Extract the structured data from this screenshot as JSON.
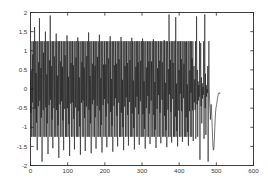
{
  "figure": {
    "background_color": "#ffffff",
    "axis_color": "#2b2b2b",
    "line_color": "#1c1c1c",
    "tick_label_color": "#3a3a3a"
  },
  "chart_data": {
    "type": "line",
    "title": "",
    "subtitle": "",
    "xlabel": "",
    "ylabel": "",
    "xlim": [
      0,
      600
    ],
    "ylim": [
      -2,
      2
    ],
    "xticks": [
      0,
      100,
      200,
      300,
      400,
      500,
      600
    ],
    "xticklabels": [
      "0",
      "100",
      "200",
      "300",
      "400",
      "500",
      "600"
    ],
    "yticks": [
      -2,
      -1.5,
      -1,
      -0.5,
      0,
      0.5,
      1,
      1.5,
      2
    ],
    "yticklabels": [
      "-2",
      "-1.5",
      "-1",
      "-0.5",
      "0",
      "0.5",
      "1",
      "1.5",
      "2"
    ],
    "grid": false,
    "legend": false,
    "legend_position": "none",
    "annotations": [],
    "series": [
      {
        "name": "signal",
        "color": "#1c1c1c",
        "linewidth": 0.62,
        "description": "Dense high-frequency oscillating waveform spanning x from 0 to about 510, clipped envelope near plus and minus 1.25 with intermittent spikes reaching plus and minus 2, becoming sparse after x of about 400 and ending with a smooth low-frequency tail dipping to about -1.6 near x of 490 before rising to about -0.1 at x of 510.",
        "x_start": 0,
        "x_end": 510,
        "envelope_typical": 1.25,
        "envelope_peak": 2.0,
        "values": [
          0.25,
          -0.62,
          0.48,
          -1.25,
          1.25,
          -0.35,
          0.9,
          -1.25,
          1.25,
          0.1,
          -1.25,
          1.62,
          -0.52,
          1.25,
          -1.25,
          0.42,
          -0.88,
          1.25,
          -1.6,
          0.35,
          1.25,
          -0.45,
          0.7,
          -1.25,
          1.85,
          -0.3,
          1.25,
          -1.25,
          0.55,
          -0.75,
          1.25,
          -1.9,
          0.4,
          1.25,
          -0.55,
          0.95,
          -1.25,
          1.25,
          0.2,
          -1.25,
          1.5,
          -0.48,
          1.25,
          -1.25,
          0.38,
          -0.9,
          1.25,
          -1.7,
          0.3,
          1.25,
          -0.42,
          0.75,
          -1.25,
          1.92,
          -0.28,
          1.25,
          -1.25,
          0.6,
          -0.8,
          1.25,
          -1.55,
          0.45,
          1.25,
          -0.5,
          0.85,
          -1.25,
          1.25,
          0.15,
          -1.25,
          1.45,
          -0.55,
          1.25,
          -1.25,
          0.35,
          -0.95,
          1.25,
          -1.8,
          0.28,
          1.25,
          -0.4,
          0.72,
          -1.25,
          1.25,
          -0.32,
          1.25,
          -1.25,
          0.58,
          -0.82,
          1.25,
          -1.6,
          0.42,
          1.25,
          -0.52,
          0.88,
          -1.25,
          1.25,
          0.18,
          -1.25,
          1.4,
          -0.5,
          1.25,
          -1.25,
          0.32,
          -0.92,
          1.25,
          -1.75,
          0.25,
          1.25,
          -0.38,
          0.68,
          -1.25,
          1.25,
          -0.35,
          1.25,
          -1.25,
          0.62,
          -0.78,
          1.25,
          -1.58,
          0.4,
          1.25,
          -0.48,
          0.82,
          -1.25,
          1.25,
          0.22,
          -1.25,
          1.35,
          -0.58,
          1.25,
          -1.25,
          0.3,
          -0.98,
          1.25,
          -1.72,
          0.26,
          1.25,
          -0.36,
          0.7,
          -1.25,
          1.25,
          -0.3,
          1.25,
          -1.25,
          0.56,
          -0.76,
          1.25,
          -1.62,
          0.38,
          1.25,
          -0.46,
          0.86,
          -1.25,
          1.25,
          0.2,
          -1.25,
          1.48,
          -0.54,
          1.25,
          -1.25,
          0.34,
          -0.9,
          1.25,
          -1.68,
          0.24,
          1.25,
          -0.4,
          0.66,
          -1.25,
          1.25,
          -0.28,
          1.25,
          -1.25,
          0.6,
          -0.74,
          1.25,
          -1.56,
          0.36,
          1.25,
          -0.44,
          0.84,
          -1.25,
          1.25,
          0.16,
          -1.25,
          1.42,
          -0.56,
          1.25,
          -1.25,
          0.28,
          -0.94,
          1.25,
          -1.66,
          0.22,
          1.25,
          -0.42,
          0.64,
          -1.25,
          1.25,
          -0.26,
          1.25,
          -1.25,
          0.64,
          -0.72,
          1.25,
          -1.52,
          0.34,
          1.25,
          -0.38,
          0.8,
          -1.25,
          1.25,
          0.14,
          -1.25,
          1.38,
          -0.6,
          1.25,
          -1.25,
          0.26,
          -0.96,
          1.25,
          -1.64,
          0.2,
          1.25,
          -0.44,
          0.62,
          -1.25,
          1.25,
          -0.24,
          1.25,
          -1.25,
          0.66,
          -0.7,
          1.25,
          -1.5,
          0.32,
          1.25,
          -0.36,
          0.78,
          -1.25,
          1.25,
          0.12,
          -1.25,
          1.36,
          -0.62,
          1.25,
          -1.25,
          0.24,
          -1.0,
          1.25,
          -1.6,
          0.18,
          1.25,
          -0.46,
          0.6,
          -1.25,
          1.25,
          -0.22,
          1.25,
          -1.25,
          0.68,
          -0.68,
          1.25,
          -1.48,
          0.3,
          1.25,
          -0.34,
          0.76,
          -1.25,
          1.25,
          0.1,
          -1.25,
          1.34,
          -0.64,
          1.25,
          -1.25,
          0.22,
          -1.02,
          1.25,
          -1.58,
          0.16,
          1.25,
          -0.48,
          0.58,
          -1.25,
          1.25,
          -0.2,
          1.25,
          -1.25,
          0.7,
          -0.66,
          1.25,
          -1.46,
          0.28,
          1.25,
          -0.32,
          0.74,
          -1.25,
          1.25,
          0.08,
          -1.25,
          1.32,
          -0.66,
          1.25,
          -1.25,
          0.2,
          -1.04,
          1.25,
          -1.56,
          0.14,
          1.25,
          -0.5,
          0.56,
          -1.25,
          1.25,
          -0.18,
          1.25,
          -1.25,
          0.72,
          -0.64,
          1.25,
          -1.44,
          0.26,
          1.25,
          -0.3,
          0.72,
          -1.25,
          1.25,
          0.06,
          -1.25,
          1.3,
          -0.68,
          1.25,
          -1.25,
          0.18,
          -1.06,
          1.25,
          -1.54,
          0.12,
          1.25,
          -0.52,
          0.54,
          -1.25,
          1.25,
          -0.16,
          1.25,
          -1.25,
          0.74,
          -0.62,
          1.25,
          -1.42,
          0.24,
          1.25,
          -0.28,
          0.7,
          -1.25,
          1.25,
          0.04,
          -1.25,
          1.28,
          -0.7,
          1.25,
          -1.25,
          0.16,
          -1.08,
          1.25,
          -1.52,
          0.1,
          1.25,
          -0.54,
          0.52,
          -1.25,
          1.95,
          -0.14,
          1.25,
          -1.25,
          0.76,
          -0.6,
          1.25,
          -1.4,
          0.22,
          1.25,
          -0.26,
          0.68,
          -1.25,
          1.25,
          0.02,
          -1.25,
          1.26,
          -0.72,
          1.88,
          -1.25,
          0.14,
          -1.1,
          1.25,
          -1.5,
          0.08,
          1.25,
          -0.56,
          0.5,
          -1.25,
          1.25,
          -0.12,
          1.25,
          -1.25,
          0.78,
          -0.58,
          1.25,
          -1.38,
          0.2,
          1.25,
          -0.24,
          0.66,
          -1.25,
          1.25,
          0.0,
          -1.25,
          1.24,
          -0.74,
          1.25,
          -1.25,
          0.12,
          -1.12,
          1.25,
          -1.48,
          0.06,
          1.25,
          -0.58,
          0.48,
          -1.25,
          1.25,
          -0.1,
          1.25,
          -1.25,
          0.8,
          -0.56,
          1.25,
          -1.36,
          0.18,
          0.6,
          -0.35,
          0.25,
          -0.55,
          1.25,
          -1.3,
          0.3,
          1.9,
          -0.4,
          0.5,
          -1.25,
          0.2,
          -0.3,
          0.1,
          -0.2,
          1.25,
          -1.85,
          0.35,
          1.2,
          -0.45,
          0.3,
          -0.9,
          0.15,
          -0.25,
          0.05,
          -0.15,
          1.25,
          -1.3,
          0.25,
          1.95,
          -0.5,
          0.4,
          -1.2,
          0.1,
          -0.2,
          0.0,
          -0.1,
          0.6,
          -1.9,
          0.2,
          1.25,
          -0.05,
          -0.3,
          -0.55,
          -0.8,
          -0.6,
          -0.4,
          -0.55,
          -0.75,
          -1.0,
          -1.3,
          -1.5,
          -1.6,
          -1.58,
          -1.45,
          -1.25,
          -1.0,
          -0.78,
          -0.6,
          -0.5,
          -0.45,
          -0.4,
          -0.32,
          -0.25,
          -0.2,
          -0.15,
          -0.12,
          -0.1,
          -0.1,
          -0.12,
          -0.1
        ]
      }
    ]
  }
}
